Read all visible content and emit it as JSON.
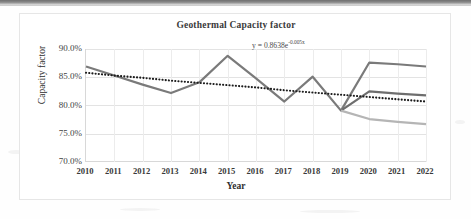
{
  "page": {
    "background_color": "#fefefe",
    "top_bar_color": "#8a8a8a"
  },
  "chart_data": {
    "type": "line",
    "title": "Geothermal Capacity factor",
    "xlabel": "Year",
    "ylabel": "Capacity factor",
    "categories": [
      "2010",
      "2011",
      "2012",
      "2013",
      "2014",
      "2015",
      "2016",
      "2017",
      "2018",
      "2019",
      "2020",
      "2021",
      "2022"
    ],
    "x_tick_labels": [
      "2010",
      "2011",
      "2012",
      "2013",
      "2014",
      "2015",
      "2016",
      "2017",
      "2018",
      "2019",
      "2020",
      "2021",
      "2022"
    ],
    "y_tick_labels": [
      "90.0%",
      "85.0%",
      "80.0%",
      "75.0%",
      "70.0%"
    ],
    "y_tick_values": [
      90.0,
      85.0,
      80.0,
      75.0,
      70.0
    ],
    "ylim": [
      70.0,
      90.0
    ],
    "xlim": [
      2010,
      2022
    ],
    "grid": "both",
    "legend": "none",
    "series": [
      {
        "name": "Capacity factor - high case",
        "color": "#7a7a7a",
        "width": 2.2,
        "style": "solid",
        "values": [
          86.9,
          85.3,
          83.7,
          82.2,
          84.1,
          88.8,
          84.8,
          80.7,
          85.1,
          79.1,
          87.6,
          87.3,
          86.9
        ]
      },
      {
        "name": "Capacity factor - mid case",
        "color": "#6e6e6e",
        "width": 2.2,
        "style": "solid",
        "values": [
          null,
          null,
          null,
          null,
          null,
          null,
          null,
          null,
          null,
          79.1,
          82.5,
          82.1,
          81.8
        ]
      },
      {
        "name": "Capacity factor - low case",
        "color": "#b5b5b5",
        "width": 2.2,
        "style": "solid",
        "values": [
          null,
          null,
          null,
          null,
          null,
          null,
          null,
          null,
          null,
          79.1,
          77.6,
          77.1,
          76.7
        ]
      },
      {
        "name": "Exponential trendline",
        "color": "#1c1c1c",
        "width": 1.8,
        "style": "dotted",
        "values": [
          85.8,
          85.3,
          84.9,
          84.4,
          84.0,
          83.6,
          83.2,
          82.7,
          82.3,
          81.9,
          81.5,
          81.1,
          80.7
        ]
      }
    ],
    "annotations": [
      {
        "name": "trendline-equation",
        "text_prefix": "y = 0.8638e",
        "text_exponent": "-0.005x",
        "full_text": "y = 0.8638e-0.005x"
      }
    ]
  }
}
